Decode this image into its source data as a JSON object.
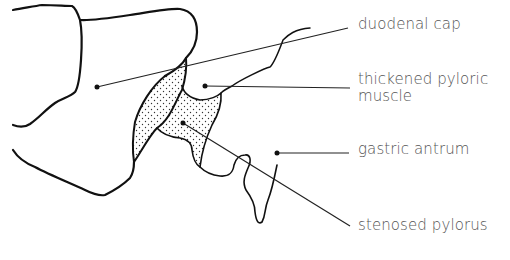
{
  "diagram": {
    "labels": [
      {
        "id": "duodenal-cap",
        "text": "duodenal cap"
      },
      {
        "id": "thickened-pyloric-muscle",
        "line1": "thickened pyloric",
        "line2": "muscle"
      },
      {
        "id": "gastric-antrum",
        "text": "gastric antrum"
      },
      {
        "id": "stenosed-pylorus",
        "text": "stenosed pylorus"
      }
    ],
    "colors": {
      "outline": "#111111",
      "leader": "#222222",
      "text": "#555555",
      "stipple": "#333333",
      "background": "#ffffff"
    }
  }
}
